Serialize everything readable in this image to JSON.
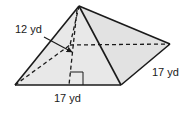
{
  "diagram": {
    "type": "square pyramid",
    "labels": {
      "slant_height": "12 yd",
      "base_side_right": "17 yd",
      "base_side_front": "17 yd"
    },
    "colors": {
      "face_fill": "#e6e6e6",
      "edge": "#1a1a1a",
      "background": "#ffffff"
    }
  }
}
